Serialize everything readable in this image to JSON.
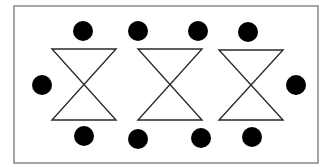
{
  "diagram": {
    "frame": {
      "x": 14,
      "y": 6,
      "width": 304,
      "height": 157,
      "stroke": "#8a8a8a"
    },
    "colors": {
      "line": "#2a2a2a",
      "dot": "#000000",
      "background": "#ffffff"
    },
    "hourglasses": [
      {
        "x1": 52,
        "x2": 116,
        "top": 49,
        "bottom": 120
      },
      {
        "x1": 138,
        "x2": 202,
        "top": 49,
        "bottom": 120
      },
      {
        "x1": 219,
        "x2": 283,
        "top": 50,
        "bottom": 120
      }
    ],
    "dots": [
      {
        "cx": 83,
        "cy": 31,
        "r": 10
      },
      {
        "cx": 138,
        "cy": 31,
        "r": 10
      },
      {
        "cx": 198,
        "cy": 31,
        "r": 10
      },
      {
        "cx": 248,
        "cy": 32,
        "r": 10
      },
      {
        "cx": 42,
        "cy": 85,
        "r": 10
      },
      {
        "cx": 296,
        "cy": 85,
        "r": 10
      },
      {
        "cx": 84,
        "cy": 136,
        "r": 10
      },
      {
        "cx": 138,
        "cy": 139,
        "r": 10
      },
      {
        "cx": 201,
        "cy": 138,
        "r": 10
      },
      {
        "cx": 252,
        "cy": 137,
        "r": 10
      }
    ]
  }
}
